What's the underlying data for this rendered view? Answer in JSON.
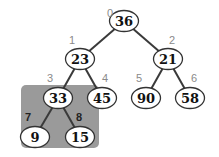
{
  "diagram": {
    "type": "binary-heap-tree",
    "highlight": {
      "x": 21,
      "y": 85,
      "width": 78,
      "height": 63,
      "color": "#9a9a9a",
      "covers_nodes": [
        3,
        7,
        8
      ]
    },
    "nodes": [
      {
        "index": 0,
        "value": "36",
        "cx": 124,
        "cy": 21,
        "ix": 110,
        "iy": 17
      },
      {
        "index": 1,
        "value": "23",
        "cx": 80,
        "cy": 59,
        "ix": 72,
        "iy": 44
      },
      {
        "index": 2,
        "value": "21",
        "cx": 168,
        "cy": 59,
        "ix": 172,
        "iy": 44
      },
      {
        "index": 3,
        "value": "33",
        "cx": 58,
        "cy": 98,
        "ix": 50,
        "iy": 82
      },
      {
        "index": 4,
        "value": "45",
        "cx": 102,
        "cy": 98,
        "ix": 105,
        "iy": 82
      },
      {
        "index": 5,
        "value": "90",
        "cx": 146,
        "cy": 98,
        "ix": 139,
        "iy": 82
      },
      {
        "index": 6,
        "value": "58",
        "cx": 190,
        "cy": 98,
        "ix": 194,
        "iy": 82
      },
      {
        "index": 7,
        "value": "9",
        "cx": 35,
        "cy": 137,
        "ix": 28,
        "iy": 121
      },
      {
        "index": 8,
        "value": "15",
        "cx": 80,
        "cy": 137,
        "ix": 79,
        "iy": 121
      }
    ],
    "edges": [
      [
        0,
        1
      ],
      [
        0,
        2
      ],
      [
        1,
        3
      ],
      [
        1,
        4
      ],
      [
        2,
        5
      ],
      [
        2,
        6
      ],
      [
        3,
        7
      ],
      [
        3,
        8
      ]
    ]
  }
}
